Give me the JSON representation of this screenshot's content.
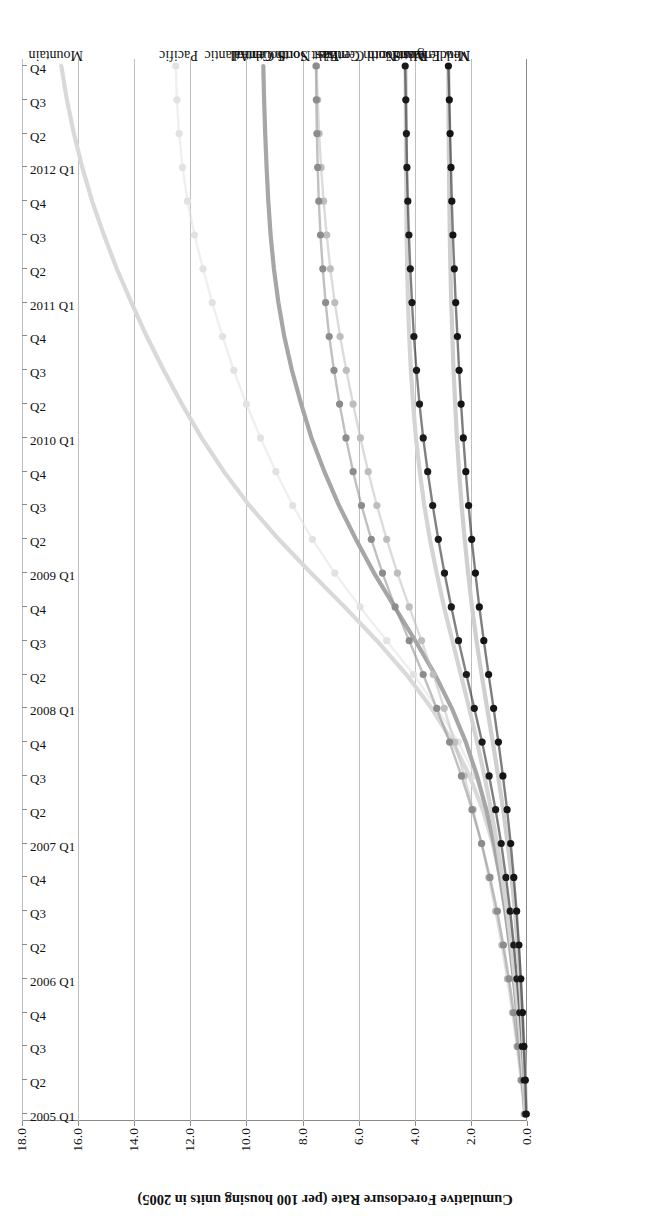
{
  "chart_data": {
    "type": "line",
    "title": "",
    "xlabel": "",
    "ylabel": "Cumulative Foreclosure Rate (per 100 housing units in 2005)",
    "ylim": [
      0.0,
      18.0
    ],
    "yticks": [
      "0.0",
      "2.0",
      "4.0",
      "6.0",
      "8.0",
      "10.0",
      "12.0",
      "14.0",
      "16.0",
      "18.0"
    ],
    "ytick_values": [
      0.0,
      2.0,
      4.0,
      6.0,
      8.0,
      10.0,
      12.0,
      14.0,
      16.0,
      18.0
    ],
    "grid": true,
    "legend": "inline-right-end-labels",
    "rotation_note": "figure printed upside down (180 degrees)",
    "x": [
      "2005 Q1",
      "Q2",
      "Q3",
      "Q4",
      "2006 Q1",
      "Q2",
      "Q3",
      "Q4",
      "2007 Q1",
      "Q2",
      "Q3",
      "Q4",
      "2008 Q1",
      "Q2",
      "Q3",
      "Q4",
      "2009 Q1",
      "Q2",
      "Q3",
      "Q4",
      "2010 Q1",
      "Q2",
      "Q3",
      "Q4",
      "2011 Q1",
      "Q2",
      "Q3",
      "Q4",
      "2012 Q1",
      "Q2",
      "Q3",
      "Q4"
    ],
    "series": [
      {
        "name": "Mountain",
        "color": "#d9d9d9",
        "style": "solid",
        "marker": "none",
        "values": [
          0.05,
          0.12,
          0.21,
          0.31,
          0.43,
          0.57,
          0.74,
          0.95,
          1.22,
          1.58,
          2.05,
          2.65,
          3.4,
          4.3,
          5.35,
          6.5,
          7.7,
          8.85,
          9.9,
          10.8,
          11.6,
          12.3,
          12.95,
          13.55,
          14.1,
          14.62,
          15.08,
          15.5,
          15.85,
          16.15,
          16.4,
          16.6
        ]
      },
      {
        "name": "Pacific",
        "color": "#e2e2e2",
        "style": "dotted",
        "marker": "circle",
        "values": [
          0.04,
          0.09,
          0.16,
          0.24,
          0.34,
          0.46,
          0.61,
          0.8,
          1.05,
          1.4,
          1.85,
          2.45,
          3.2,
          4.05,
          5.0,
          5.95,
          6.85,
          7.65,
          8.35,
          8.95,
          9.5,
          10.0,
          10.45,
          10.85,
          11.22,
          11.55,
          11.85,
          12.1,
          12.28,
          12.4,
          12.48,
          12.52
        ]
      },
      {
        "name": "South Atlantic",
        "color": "#a6a6a6",
        "style": "solid",
        "marker": "none",
        "values": [
          0.06,
          0.14,
          0.24,
          0.35,
          0.47,
          0.61,
          0.77,
          0.96,
          1.18,
          1.45,
          1.78,
          2.18,
          2.68,
          3.28,
          3.98,
          4.72,
          5.45,
          6.1,
          6.7,
          7.22,
          7.68,
          8.05,
          8.38,
          8.65,
          8.86,
          9.02,
          9.14,
          9.22,
          9.28,
          9.33,
          9.37,
          9.4
        ]
      },
      {
        "name": "West South Central",
        "color": "#bdbdbd",
        "style": "dotted",
        "marker": "circle",
        "values": [
          0.1,
          0.22,
          0.36,
          0.52,
          0.7,
          0.9,
          1.12,
          1.36,
          1.62,
          1.92,
          2.24,
          2.58,
          2.95,
          3.34,
          3.76,
          4.2,
          4.62,
          5.0,
          5.35,
          5.66,
          5.94,
          6.2,
          6.44,
          6.66,
          6.85,
          7.01,
          7.14,
          7.25,
          7.34,
          7.41,
          7.46,
          7.5
        ]
      },
      {
        "name": "East North Central",
        "color": "#8c8c8c",
        "style": "dotted",
        "marker": "circle",
        "values": [
          0.08,
          0.19,
          0.32,
          0.47,
          0.64,
          0.84,
          1.06,
          1.32,
          1.62,
          1.96,
          2.34,
          2.76,
          3.22,
          3.7,
          4.2,
          4.7,
          5.15,
          5.55,
          5.9,
          6.2,
          6.45,
          6.68,
          6.88,
          7.05,
          7.18,
          7.28,
          7.36,
          7.42,
          7.46,
          7.49,
          7.51,
          7.52
        ]
      },
      {
        "name": "East South Central",
        "color": "#d4d4d4",
        "style": "solid",
        "marker": "none",
        "values": [
          0.05,
          0.12,
          0.21,
          0.31,
          0.43,
          0.56,
          0.71,
          0.88,
          1.07,
          1.28,
          1.52,
          1.78,
          2.06,
          2.36,
          2.66,
          2.96,
          3.22,
          3.46,
          3.66,
          3.82,
          3.96,
          4.06,
          4.14,
          4.2,
          4.24,
          4.27,
          4.29,
          4.3,
          4.31,
          4.32,
          4.32,
          4.33
        ]
      },
      {
        "name": "West North Central",
        "color": "#1a1a1a",
        "style": "dotted",
        "marker": "circle",
        "values": [
          0.04,
          0.1,
          0.17,
          0.26,
          0.36,
          0.47,
          0.6,
          0.75,
          0.92,
          1.12,
          1.35,
          1.6,
          1.88,
          2.16,
          2.44,
          2.7,
          2.94,
          3.16,
          3.36,
          3.54,
          3.7,
          3.83,
          3.94,
          4.03,
          4.1,
          4.16,
          4.21,
          4.25,
          4.28,
          4.3,
          4.32,
          4.34
        ]
      },
      {
        "name": "New England",
        "color": "#cfcfcf",
        "style": "solid",
        "marker": "none",
        "values": [
          0.03,
          0.07,
          0.12,
          0.18,
          0.25,
          0.33,
          0.43,
          0.55,
          0.69,
          0.85,
          1.03,
          1.22,
          1.42,
          1.62,
          1.8,
          1.96,
          2.1,
          2.22,
          2.33,
          2.42,
          2.5,
          2.56,
          2.62,
          2.66,
          2.7,
          2.73,
          2.75,
          2.77,
          2.78,
          2.79,
          2.8,
          2.8
        ]
      },
      {
        "name": "Middle Atlantic",
        "color": "#141414",
        "style": "dotted",
        "marker": "circle",
        "values": [
          0.03,
          0.06,
          0.11,
          0.16,
          0.22,
          0.29,
          0.37,
          0.47,
          0.58,
          0.71,
          0.86,
          1.02,
          1.19,
          1.37,
          1.54,
          1.7,
          1.84,
          1.97,
          2.08,
          2.18,
          2.27,
          2.35,
          2.42,
          2.48,
          2.54,
          2.59,
          2.64,
          2.68,
          2.71,
          2.74,
          2.77,
          2.8
        ]
      }
    ]
  }
}
